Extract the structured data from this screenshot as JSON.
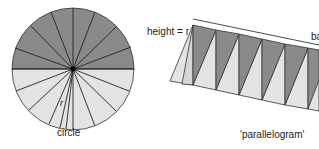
{
  "diagram": {
    "colors": {
      "dark_sector": "#8a8a8a",
      "light_sector": "#e3e3e3",
      "stroke": "#333333",
      "center_dot": "#000000"
    },
    "circle": {
      "label": "circle",
      "radius_label": "r",
      "sector_count": 24,
      "top_half": "dark",
      "bottom_half": "light"
    },
    "parallelogram": {
      "label": "'parallelogram'",
      "height_label": "height = r",
      "base_label": "ba",
      "visible_dark_wedges": 6,
      "visible_light_wedges": 7
    }
  }
}
